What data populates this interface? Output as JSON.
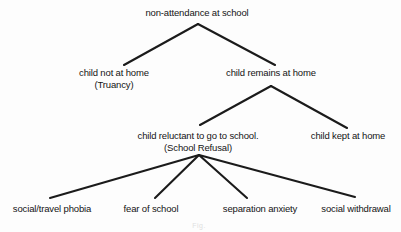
{
  "diagram": {
    "type": "tree-hierarchy",
    "title": "non-attendance at school",
    "background_color": "#fdfdfd",
    "line_color": "#1b1b1b",
    "text_color": "#141414",
    "nodes": [
      {
        "id": "root",
        "label": "non-attendance at school",
        "line2": "",
        "x": 197,
        "y": 7,
        "level": 0
      },
      {
        "id": "not-at-home",
        "label": "child not at home",
        "line2": "(Truancy)",
        "x": 114,
        "y": 67,
        "level": 1
      },
      {
        "id": "remains-at-home",
        "label": "child remains at home",
        "line2": "",
        "x": 271,
        "y": 67,
        "level": 1
      },
      {
        "id": "reluctant",
        "label": "child reluctant to go to school.",
        "line2": "(School Refusal)",
        "x": 198,
        "y": 130,
        "level": 2
      },
      {
        "id": "kept-at-home",
        "label": "child kept at home",
        "line2": "",
        "x": 348,
        "y": 130,
        "level": 2
      },
      {
        "id": "social-travel-phobia",
        "label": "social/travel phobia",
        "line2": "",
        "x": 52,
        "y": 203,
        "level": 3
      },
      {
        "id": "fear-of-school",
        "label": "fear of school",
        "line2": "",
        "x": 151,
        "y": 203,
        "level": 3
      },
      {
        "id": "separation-anxiety",
        "label": "separation anxiety",
        "line2": "",
        "x": 260,
        "y": 203,
        "level": 3
      },
      {
        "id": "social-withdrawal",
        "label": "social withdrawal",
        "line2": "",
        "x": 356,
        "y": 203,
        "level": 3
      }
    ],
    "edges": [
      {
        "from": "root",
        "to": "not-at-home",
        "x1": 198,
        "y1": 24,
        "x2": 124,
        "y2": 65
      },
      {
        "from": "root",
        "to": "remains-at-home",
        "x1": 198,
        "y1": 24,
        "x2": 275,
        "y2": 65
      },
      {
        "from": "remains-at-home",
        "to": "reluctant",
        "x1": 271,
        "y1": 86,
        "x2": 200,
        "y2": 125
      },
      {
        "from": "remains-at-home",
        "to": "kept-at-home",
        "x1": 271,
        "y1": 86,
        "x2": 347,
        "y2": 128
      },
      {
        "from": "reluctant",
        "to": "social-travel-phobia",
        "x1": 199,
        "y1": 155,
        "x2": 50,
        "y2": 198
      },
      {
        "from": "reluctant",
        "to": "fear-of-school",
        "x1": 199,
        "y1": 155,
        "x2": 155,
        "y2": 198
      },
      {
        "from": "reluctant",
        "to": "separation-anxiety",
        "x1": 199,
        "y1": 155,
        "x2": 247,
        "y2": 198
      },
      {
        "from": "reluctant",
        "to": "social-withdrawal",
        "x1": 199,
        "y1": 155,
        "x2": 355,
        "y2": 197
      }
    ],
    "artifact": {
      "text": "Fig.",
      "x": 199,
      "y": 222
    }
  }
}
